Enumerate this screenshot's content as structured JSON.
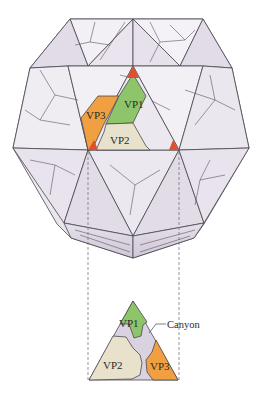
{
  "figure": {
    "capsid_labels": {
      "vp1": "VP1",
      "vp2": "VP2",
      "vp3": "VP3"
    },
    "inset_labels": {
      "vp1": "VP1",
      "vp2": "VP2",
      "vp3": "VP3",
      "canyon": "Canyon"
    },
    "colors": {
      "vp1": "#8fc56a",
      "vp2": "#e8e2cc",
      "vp3": "#f0a040",
      "fivefold_vertex": "#e0502a",
      "capsid_face": "#ece8ef",
      "canyon": "#d9d2e0",
      "edge": "#4a4650"
    }
  }
}
